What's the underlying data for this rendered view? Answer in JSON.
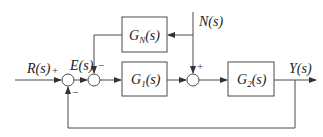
{
  "diagram": {
    "type": "control-system-block-diagram",
    "signals": {
      "input": "R(s)",
      "error": "E(s)",
      "disturbance": "N(s)",
      "output": "Y(s)"
    },
    "blocks": [
      {
        "id": "gn",
        "base": "G",
        "sub": "N",
        "arg": "(s)"
      },
      {
        "id": "g1",
        "base": "G",
        "sub": "1",
        "arg": "(s)"
      },
      {
        "id": "g2",
        "base": "G",
        "sub": "2",
        "arg": "(s)"
      }
    ],
    "summing_junctions": [
      {
        "id": "sum1",
        "signs": {
          "left": "+",
          "bottom": "−"
        }
      },
      {
        "id": "sum2",
        "signs": {
          "left": "+",
          "top": "−"
        }
      },
      {
        "id": "sum3",
        "signs": {
          "left": "+",
          "top": "+"
        }
      }
    ],
    "sign_labels": {
      "sum1_plus": "+",
      "sum1_minus": "−",
      "sum2_minus": "−",
      "sum3_plus": "+"
    }
  }
}
